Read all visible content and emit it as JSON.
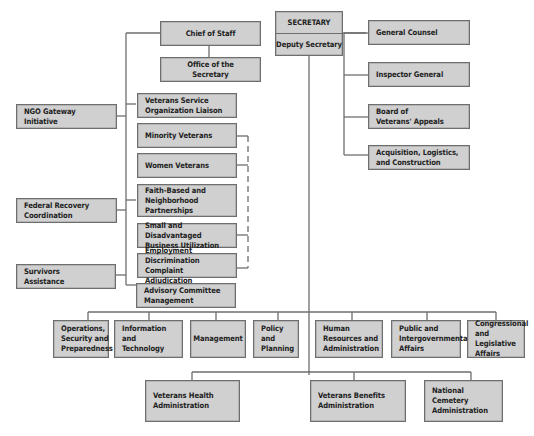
{
  "top": {
    "secretary": "SECRETARY",
    "deputy": "Deputy Secretary",
    "chief_of_staff": "Chief of Staff",
    "office_of_secretary": "Office of the Secretary"
  },
  "right_offices": [
    {
      "label": "General Counsel"
    },
    {
      "label": "Inspector General"
    },
    {
      "label": "Board of\nVeterans' Appeals"
    },
    {
      "label": "Acquisition, Logistics,\nand Construction"
    }
  ],
  "left_offices": [
    {
      "label": "NGO Gateway\nInitiative"
    },
    {
      "label": "Federal Recovery\nCoordination"
    },
    {
      "label": "Survivors\nAssistance"
    }
  ],
  "center_offices": [
    {
      "label": "Veterans Service\nOrganization Liaison"
    },
    {
      "label": "Minority Veterans"
    },
    {
      "label": "Women Veterans"
    },
    {
      "label": "Faith-Based and\nNeighborhood Partnerships"
    },
    {
      "label": "Small and Disadvantaged\nBusiness Utilization"
    },
    {
      "label": "Employment Discrimination\nComplaint Adjudication"
    },
    {
      "label": "Advisory Committee\nManagement"
    }
  ],
  "staff_offices": [
    {
      "label": "Operations,\nSecurity and\nPreparedness"
    },
    {
      "label": "Information and\nTechnology"
    },
    {
      "label": "Management"
    },
    {
      "label": "Policy and\nPlanning"
    },
    {
      "label": "Human\nResources and\nAdministration"
    },
    {
      "label": "Public and\nIntergovernmental\nAffairs"
    },
    {
      "label": "Congressional\nand Legislative\nAffairs"
    }
  ],
  "administrations": [
    {
      "label": "Veterans Health\nAdministration"
    },
    {
      "label": "Veterans Benefits\nAdministration"
    },
    {
      "label": "National Cemetery\nAdministration"
    }
  ],
  "colors": {
    "box_fill": "#d0d0d0",
    "box_border": "#6e6e6e",
    "line": "#6e6e6e"
  }
}
